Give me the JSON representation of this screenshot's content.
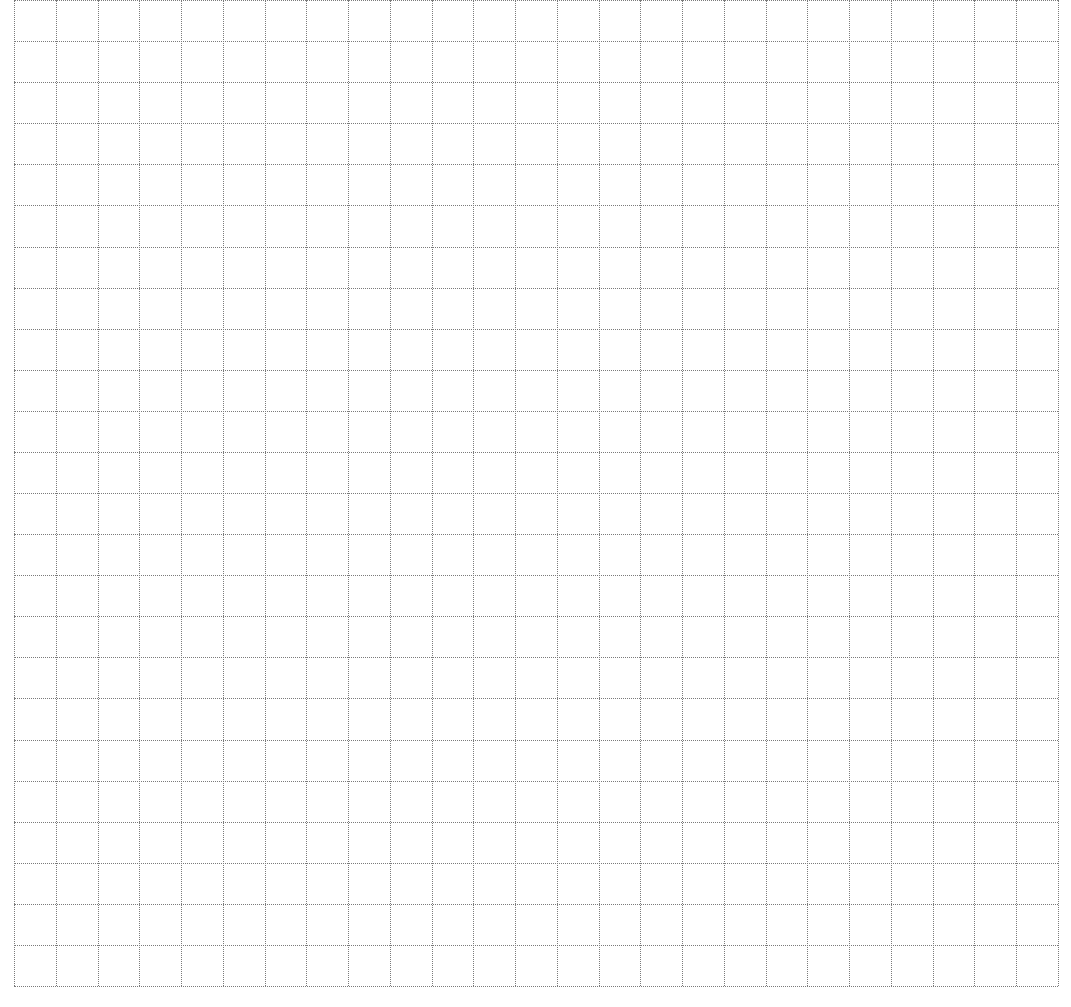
{
  "page": {
    "background_color": "#ffffff",
    "line_color": "#7a7a7a",
    "line_style": "dotted"
  },
  "grid": {
    "columns": 25,
    "rows": 24,
    "left": 14,
    "top": 0,
    "width": 1044,
    "height": 986
  }
}
